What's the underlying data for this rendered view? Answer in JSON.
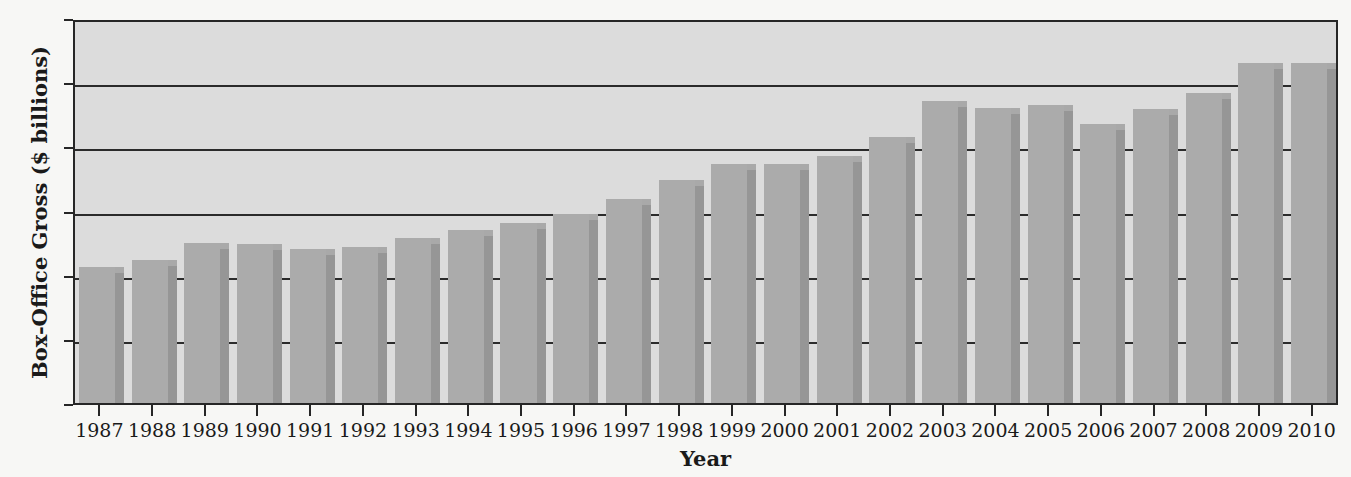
{
  "chart_data": {
    "type": "bar",
    "title": "",
    "xlabel": "Year",
    "ylabel": "Box-Office Gross ($ billions)",
    "ylim": [
      0,
      12
    ],
    "yticks": [
      "0",
      "2",
      "4",
      "6",
      "8",
      "10",
      "12"
    ],
    "ytick_values": [
      0,
      2,
      4,
      6,
      8,
      10,
      12
    ],
    "grid": true,
    "grid_axis": "y",
    "legend": "none",
    "categories": [
      "1987",
      "1988",
      "1989",
      "1990",
      "1991",
      "1992",
      "1993",
      "1994",
      "1995",
      "1996",
      "1997",
      "1998",
      "1999",
      "2000",
      "2001",
      "2002",
      "2003",
      "2004",
      "2005",
      "2006",
      "2007",
      "2008",
      "2009",
      "2010"
    ],
    "values": [
      4.25,
      4.45,
      5.0,
      4.97,
      4.8,
      4.85,
      5.15,
      5.4,
      5.6,
      5.9,
      6.35,
      6.95,
      7.45,
      7.45,
      7.7,
      8.3,
      9.4,
      9.2,
      9.3,
      8.7,
      9.15,
      9.65,
      10.6,
      10.6
    ],
    "colors": {
      "bar_face": "#ababab",
      "bar_shadow": "#969696",
      "plot_background": "#dcdcdc",
      "page_background": "#f7f7f5",
      "axis": "#262626",
      "gridline": "#2b2b2b",
      "text": "#1a1a1a"
    }
  }
}
